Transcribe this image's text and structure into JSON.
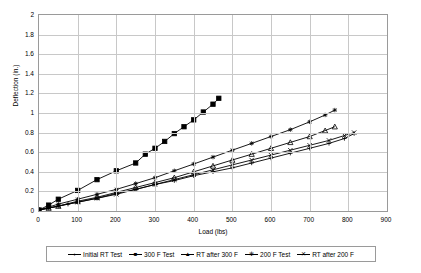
{
  "chart_data": {
    "type": "line",
    "title": "",
    "xlabel": "Load (lbs)",
    "ylabel": "Deflection (in.)",
    "xlim": [
      0,
      900
    ],
    "ylim": [
      0,
      2
    ],
    "xticks": [
      0,
      100,
      200,
      300,
      400,
      500,
      600,
      700,
      800,
      900
    ],
    "yticks": [
      0,
      0.2,
      0.4,
      0.6,
      0.8,
      1,
      1.2,
      1.4,
      1.6,
      1.8,
      2
    ],
    "grid": "horizontal-and-vertical",
    "legend_position": "bottom",
    "series": [
      {
        "name": "Initial RT Test",
        "marker": "plus",
        "color": "#000000",
        "points": [
          [
            0,
            0.01
          ],
          [
            25,
            0.03
          ],
          [
            50,
            0.05
          ],
          [
            75,
            0.07
          ],
          [
            100,
            0.09
          ],
          [
            150,
            0.13
          ],
          [
            200,
            0.18
          ],
          [
            250,
            0.22
          ],
          [
            300,
            0.27
          ],
          [
            350,
            0.31
          ],
          [
            400,
            0.36
          ],
          [
            450,
            0.4
          ],
          [
            500,
            0.44
          ],
          [
            550,
            0.49
          ],
          [
            600,
            0.54
          ],
          [
            650,
            0.59
          ],
          [
            700,
            0.64
          ],
          [
            750,
            0.69
          ],
          [
            790,
            0.74
          ],
          [
            815,
            0.79
          ]
        ]
      },
      {
        "name": "300 F Test",
        "marker": "square",
        "color": "#000000",
        "points": [
          [
            0,
            0.01
          ],
          [
            25,
            0.06
          ],
          [
            50,
            0.12
          ],
          [
            100,
            0.21
          ],
          [
            150,
            0.32
          ],
          [
            200,
            0.41
          ],
          [
            250,
            0.49
          ],
          [
            275,
            0.58
          ],
          [
            300,
            0.64
          ],
          [
            325,
            0.71
          ],
          [
            350,
            0.79
          ],
          [
            375,
            0.86
          ],
          [
            400,
            0.93
          ],
          [
            425,
            1.01
          ],
          [
            450,
            1.09
          ],
          [
            465,
            1.15
          ]
        ]
      },
      {
        "name": "RT after 300 F",
        "marker": "triangle",
        "color": "#000000",
        "points": [
          [
            0,
            0.01
          ],
          [
            25,
            0.03
          ],
          [
            50,
            0.05
          ],
          [
            100,
            0.1
          ],
          [
            150,
            0.14
          ],
          [
            200,
            0.19
          ],
          [
            250,
            0.24
          ],
          [
            300,
            0.29
          ],
          [
            350,
            0.34
          ],
          [
            400,
            0.4
          ],
          [
            450,
            0.46
          ],
          [
            500,
            0.52
          ],
          [
            550,
            0.58
          ],
          [
            600,
            0.64
          ],
          [
            650,
            0.7
          ],
          [
            700,
            0.76
          ],
          [
            740,
            0.82
          ],
          [
            765,
            0.86
          ]
        ]
      },
      {
        "name": "200 F Test",
        "marker": "star",
        "color": "#000000",
        "points": [
          [
            0,
            0.01
          ],
          [
            25,
            0.04
          ],
          [
            50,
            0.07
          ],
          [
            100,
            0.12
          ],
          [
            150,
            0.17
          ],
          [
            200,
            0.22
          ],
          [
            250,
            0.28
          ],
          [
            300,
            0.34
          ],
          [
            350,
            0.41
          ],
          [
            400,
            0.48
          ],
          [
            450,
            0.55
          ],
          [
            500,
            0.62
          ],
          [
            550,
            0.69
          ],
          [
            600,
            0.76
          ],
          [
            650,
            0.83
          ],
          [
            700,
            0.91
          ],
          [
            740,
            0.98
          ],
          [
            765,
            1.03
          ]
        ]
      },
      {
        "name": "RT after 200 F",
        "marker": "cross",
        "color": "#000000",
        "points": [
          [
            0,
            0.01
          ],
          [
            25,
            0.03
          ],
          [
            50,
            0.05
          ],
          [
            100,
            0.09
          ],
          [
            150,
            0.13
          ],
          [
            200,
            0.17
          ],
          [
            250,
            0.22
          ],
          [
            300,
            0.27
          ],
          [
            350,
            0.32
          ],
          [
            400,
            0.37
          ],
          [
            450,
            0.42
          ],
          [
            500,
            0.47
          ],
          [
            550,
            0.52
          ],
          [
            600,
            0.57
          ],
          [
            650,
            0.62
          ],
          [
            700,
            0.67
          ],
          [
            750,
            0.72
          ],
          [
            790,
            0.77
          ],
          [
            815,
            0.8
          ]
        ]
      }
    ]
  }
}
